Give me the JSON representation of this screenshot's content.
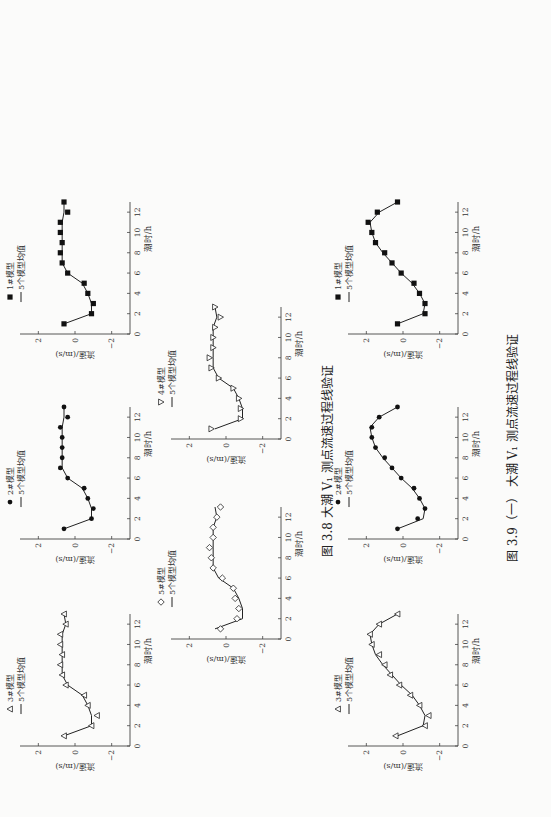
{
  "figures": [
    {
      "id": "3.8",
      "caption": "图 3.8   大潮 V₁ 测点流速过程线验证"
    },
    {
      "id": "3.9",
      "caption": "图 3.9（一）   大潮 V₁ 测点流速过程线验证"
    }
  ],
  "axis": {
    "xlabel": "潮时/h",
    "ylabel": "流速/(m/s)",
    "xticks": [
      0,
      2,
      4,
      6,
      8,
      10,
      12
    ],
    "yticks": [
      2,
      0,
      -2
    ],
    "ytick_labels": [
      "2",
      "0",
      "−2"
    ],
    "xlim": [
      0,
      13
    ],
    "ylim": [
      -3,
      3
    ]
  },
  "chart_data": [
    {
      "figure": "3.8",
      "type": "line",
      "title": "1#模型",
      "legend": [
        "1#模型",
        "5个模型均值"
      ],
      "marker": "square",
      "xlabel": "潮时/h",
      "ylabel": "流速/(m/s)",
      "xlim": [
        0,
        13
      ],
      "ylim": [
        -3,
        3
      ],
      "x": [
        1,
        2,
        3,
        4,
        5,
        6,
        7,
        8,
        9,
        10,
        11,
        12,
        13
      ],
      "series": [
        {
          "name": "1#模型",
          "values": [
            0.6,
            -0.9,
            -1.0,
            -0.7,
            -0.5,
            0.4,
            0.7,
            0.8,
            0.7,
            0.8,
            0.8,
            0.4,
            0.6
          ]
        },
        {
          "name": "5个模型均值",
          "values": [
            0.6,
            -0.9,
            -0.9,
            -0.7,
            -0.4,
            0.4,
            0.7,
            0.7,
            0.7,
            0.7,
            0.7,
            0.6,
            0.6
          ]
        }
      ]
    },
    {
      "figure": "3.8",
      "type": "line",
      "title": "2#模型",
      "legend": [
        "2#模型",
        "5个模型均值"
      ],
      "marker": "circle",
      "xlabel": "潮时/h",
      "ylabel": "流速/(m/s)",
      "xlim": [
        0,
        13
      ],
      "ylim": [
        -3,
        3
      ],
      "x": [
        1,
        2,
        3,
        4,
        5,
        6,
        7,
        8,
        9,
        10,
        11,
        12,
        13
      ],
      "series": [
        {
          "name": "2#模型",
          "values": [
            0.6,
            -0.9,
            -1.0,
            -0.7,
            -0.5,
            0.4,
            0.8,
            0.7,
            0.7,
            0.7,
            0.8,
            0.4,
            0.6
          ]
        },
        {
          "name": "5个模型均值",
          "values": [
            0.6,
            -0.9,
            -0.9,
            -0.7,
            -0.4,
            0.4,
            0.7,
            0.7,
            0.7,
            0.7,
            0.7,
            0.6,
            0.6
          ]
        }
      ]
    },
    {
      "figure": "3.8",
      "type": "line",
      "title": "3#模型",
      "legend": [
        "3#模型",
        "5个模型均值"
      ],
      "marker": "triangle-up",
      "xlabel": "潮时/h",
      "ylabel": "流速/(m/s)",
      "xlim": [
        0,
        13
      ],
      "ylim": [
        -3,
        3
      ],
      "x": [
        1,
        2,
        3,
        4,
        5,
        6,
        7,
        8,
        9,
        10,
        11,
        12,
        13
      ],
      "series": [
        {
          "name": "3#模型",
          "values": [
            0.6,
            -0.9,
            -1.2,
            -0.7,
            -0.5,
            0.5,
            0.7,
            0.8,
            0.7,
            0.8,
            0.8,
            0.5,
            0.6
          ]
        },
        {
          "name": "5个模型均值",
          "values": [
            0.6,
            -0.9,
            -0.9,
            -0.7,
            -0.4,
            0.4,
            0.7,
            0.7,
            0.7,
            0.7,
            0.7,
            0.5,
            0.6
          ]
        }
      ]
    },
    {
      "figure": "3.8",
      "type": "line",
      "title": "4#模型",
      "legend": [
        "4#模型",
        "5个模型均值"
      ],
      "marker": "triangle-down",
      "xlabel": "潮时/h",
      "ylabel": "流速/(m/s)",
      "xlim": [
        0,
        13
      ],
      "ylim": [
        -3,
        3
      ],
      "x": [
        1,
        2,
        3,
        4,
        5,
        6,
        7,
        8,
        9,
        10,
        11,
        12,
        13
      ],
      "series": [
        {
          "name": "4#模型",
          "values": [
            0.8,
            -0.8,
            -0.8,
            -0.7,
            -0.4,
            0.4,
            0.8,
            0.9,
            0.7,
            0.7,
            0.6,
            0.3,
            0.6
          ]
        },
        {
          "name": "5个模型均值",
          "values": [
            0.6,
            -0.9,
            -0.9,
            -0.7,
            -0.4,
            0.4,
            0.7,
            0.7,
            0.7,
            0.7,
            0.7,
            0.5,
            0.6
          ]
        }
      ]
    },
    {
      "figure": "3.8",
      "type": "line",
      "title": "5#模型",
      "legend": [
        "5#模型",
        "5个模型均值"
      ],
      "marker": "diamond",
      "xlabel": "潮时/h",
      "ylabel": "流速/(m/s)",
      "xlim": [
        0,
        13
      ],
      "ylim": [
        -3,
        3
      ],
      "x": [
        1,
        2,
        3,
        4,
        5,
        6,
        7,
        8,
        9,
        10,
        11,
        12,
        13
      ],
      "series": [
        {
          "name": "5#模型",
          "values": [
            0.3,
            -0.6,
            -0.7,
            -0.5,
            -0.4,
            0.2,
            0.7,
            0.8,
            0.9,
            0.7,
            0.7,
            0.5,
            0.3
          ]
        },
        {
          "name": "5个模型均值",
          "values": [
            0.6,
            -0.9,
            -0.9,
            -0.7,
            -0.4,
            0.4,
            0.7,
            0.7,
            0.7,
            0.7,
            0.7,
            0.5,
            0.6
          ]
        }
      ]
    },
    {
      "figure": "3.9",
      "type": "line",
      "title": "1#模型",
      "legend": [
        "1#模型",
        "5个模型均值"
      ],
      "marker": "square",
      "xlabel": "潮时/h",
      "ylabel": "流速/(m/s)",
      "xlim": [
        0,
        13
      ],
      "ylim": [
        -3,
        3
      ],
      "x": [
        1,
        2,
        3,
        4,
        5,
        6,
        7,
        8,
        9,
        10,
        11,
        12,
        13
      ],
      "series": [
        {
          "name": "1#模型",
          "values": [
            0.3,
            -1.2,
            -1.2,
            -0.9,
            -0.6,
            0.1,
            0.6,
            1.0,
            1.5,
            1.7,
            1.9,
            1.4,
            0.3
          ]
        },
        {
          "name": "5个模型均值",
          "values": [
            0.3,
            -1.1,
            -1.2,
            -0.9,
            -0.5,
            0.1,
            0.6,
            1.1,
            1.5,
            1.7,
            1.8,
            1.3,
            0.3
          ]
        }
      ]
    },
    {
      "figure": "3.9",
      "type": "line",
      "title": "2#模型",
      "legend": [
        "2#模型",
        "5个模型均值"
      ],
      "marker": "circle",
      "xlabel": "潮时/h",
      "ylabel": "流速/(m/s)",
      "xlim": [
        0,
        13
      ],
      "ylim": [
        -3,
        3
      ],
      "x": [
        1,
        2,
        3,
        4,
        5,
        6,
        7,
        8,
        9,
        10,
        11,
        12,
        13
      ],
      "series": [
        {
          "name": "2#模型",
          "values": [
            0.3,
            -0.8,
            -1.2,
            -0.9,
            -0.6,
            0.1,
            0.6,
            1.0,
            1.5,
            1.7,
            1.7,
            1.3,
            0.3
          ]
        },
        {
          "name": "5个模型均值",
          "values": [
            0.3,
            -1.1,
            -1.2,
            -0.9,
            -0.5,
            0.1,
            0.6,
            1.1,
            1.5,
            1.7,
            1.8,
            1.3,
            0.3
          ]
        }
      ]
    },
    {
      "figure": "3.9",
      "type": "line",
      "title": "3#模型",
      "legend": [
        "3#模型",
        "5个模型均值"
      ],
      "marker": "triangle-up",
      "xlabel": "潮时/h",
      "ylabel": "流速/(m/s)",
      "xlim": [
        0,
        13
      ],
      "ylim": [
        -3,
        3
      ],
      "x": [
        1,
        2,
        3,
        4,
        5,
        6,
        7,
        8,
        9,
        10,
        11,
        12,
        13
      ],
      "series": [
        {
          "name": "3#模型",
          "values": [
            0.4,
            -1.2,
            -1.4,
            -0.9,
            -0.4,
            0.2,
            0.7,
            1.0,
            1.3,
            1.7,
            1.8,
            1.3,
            0.3
          ]
        },
        {
          "name": "5个模型均值",
          "values": [
            0.3,
            -1.1,
            -1.2,
            -0.9,
            -0.5,
            0.1,
            0.6,
            1.1,
            1.5,
            1.7,
            1.8,
            1.3,
            0.3
          ]
        }
      ]
    }
  ]
}
